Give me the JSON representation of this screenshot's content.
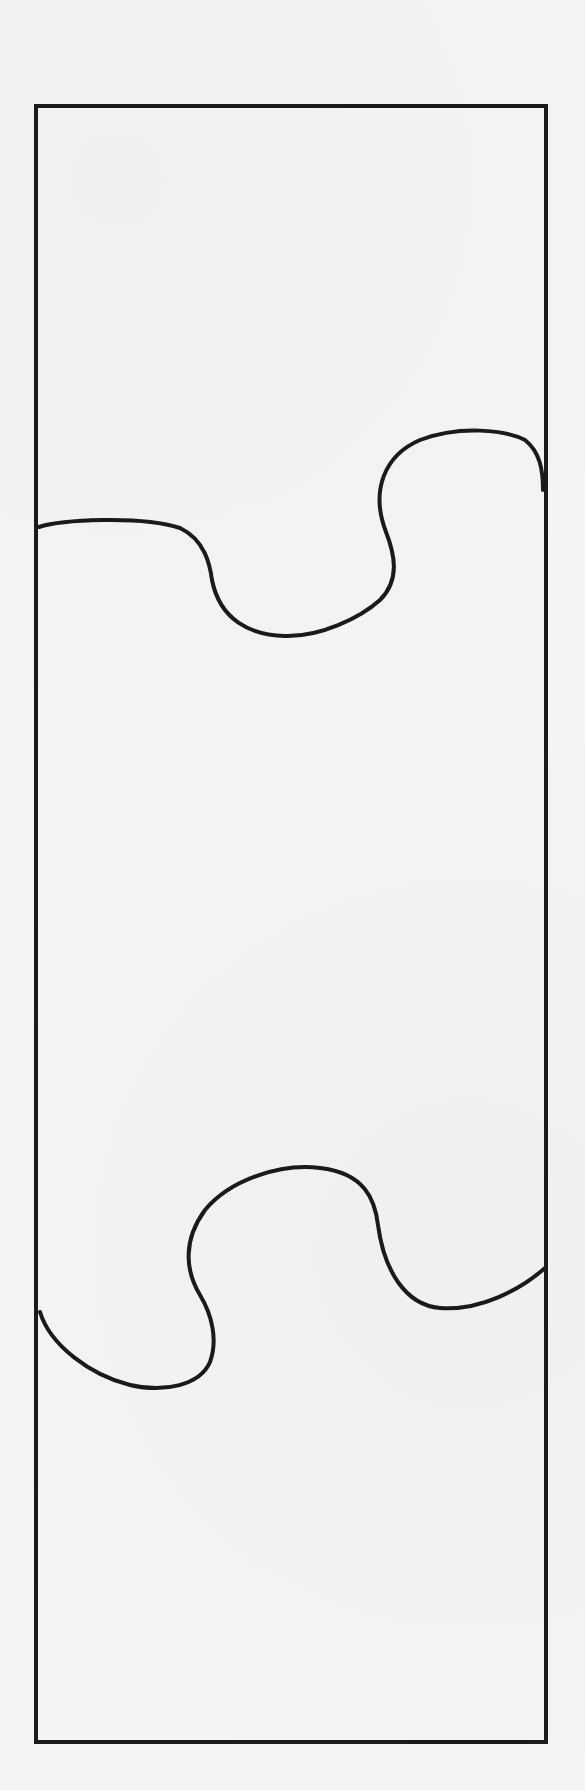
{
  "diagram": {
    "type": "puzzle-strip",
    "stroke_color": "#1a1a1a",
    "background_color": "#f4f4f2",
    "outline": {
      "x": 36,
      "y": 106,
      "width": 510,
      "height": 1636
    },
    "cut_lines": [
      {
        "id": "upper-cut",
        "path": "M 39 527 C 60 520, 140 515, 180 528 C 205 540, 210 565, 212 580 C 220 620, 250 635, 285 636 C 320 637, 360 618, 380 600 C 400 580, 395 555, 386 532 C 370 490, 385 455, 420 440 C 460 425, 505 430, 525 440 C 540 452, 543 470, 543 490"
      },
      {
        "id": "lower-cut",
        "path": "M 40 1312 C 50 1345, 90 1375, 130 1385 C 165 1393, 200 1385, 210 1362 C 218 1340, 212 1315, 200 1295 C 185 1270, 183 1240, 205 1210 C 230 1180, 280 1163, 320 1168 C 365 1173, 375 1200, 378 1225 C 384 1270, 405 1305, 440 1308 C 480 1311, 520 1290, 545 1268"
      }
    ],
    "regions": [
      "top-piece",
      "middle-piece",
      "bottom-piece"
    ]
  }
}
